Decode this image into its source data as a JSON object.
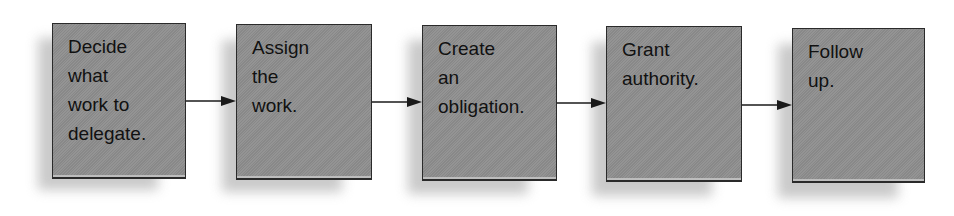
{
  "diagram": {
    "type": "process-flow",
    "direction": "left-to-right",
    "colors": {
      "box_fill": "#8e8e8e",
      "box_border": "#2a2a2a",
      "shadow": "#c4c4c4",
      "text": "#111111",
      "arrow": "#1a1a1a",
      "background": "#ffffff"
    },
    "steps": [
      {
        "label": "Decide\nwhat\nwork to\ndelegate."
      },
      {
        "label": "Assign\nthe\nwork."
      },
      {
        "label": "Create\nan\nobligation."
      },
      {
        "label": "Grant\nauthority."
      },
      {
        "label": "Follow\nup."
      }
    ],
    "connectors": [
      {
        "from": 0,
        "to": 1
      },
      {
        "from": 1,
        "to": 2
      },
      {
        "from": 2,
        "to": 3
      },
      {
        "from": 3,
        "to": 4
      }
    ]
  }
}
